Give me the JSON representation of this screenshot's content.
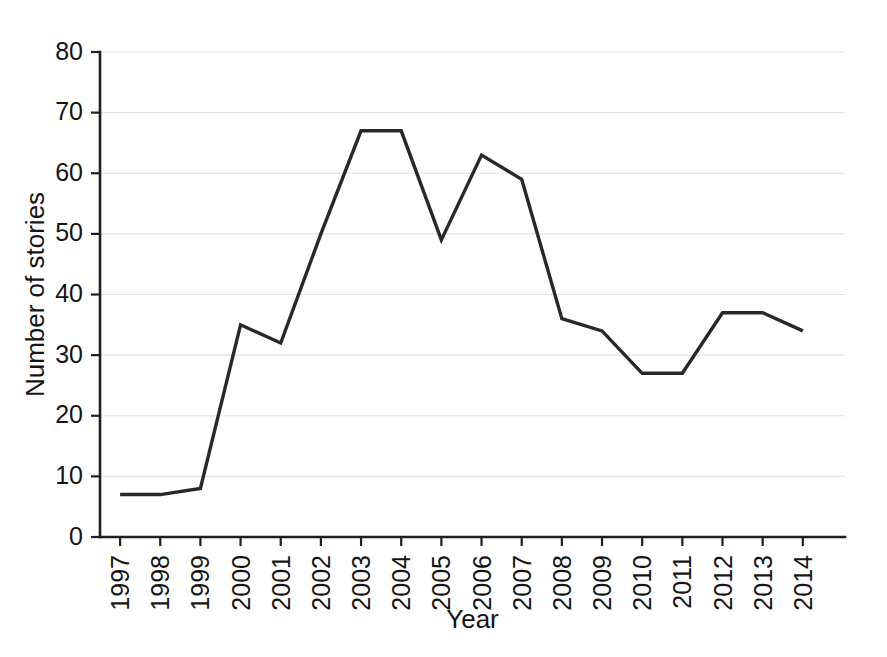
{
  "chart_data": {
    "type": "line",
    "title": "",
    "xlabel": "Year",
    "ylabel": "Number of stories",
    "categories": [
      "1997",
      "1998",
      "1999",
      "2000",
      "2001",
      "2002",
      "2003",
      "2004",
      "2005",
      "2006",
      "2007",
      "2008",
      "2009",
      "2010",
      "2011",
      "2012",
      "2013",
      "2014"
    ],
    "values": [
      7,
      7,
      8,
      35,
      32,
      50,
      67,
      67,
      49,
      63,
      59,
      36,
      34,
      27,
      27,
      37,
      37,
      34
    ],
    "series": [
      {
        "name": "Number of stories",
        "values": [
          7,
          7,
          8,
          35,
          32,
          50,
          67,
          67,
          49,
          63,
          59,
          36,
          34,
          27,
          27,
          37,
          37,
          34
        ]
      }
    ],
    "ylim": [
      0,
      80
    ],
    "ytick_values": [
      0,
      10,
      20,
      30,
      40,
      50,
      60,
      70,
      80
    ],
    "ytick_labels": [
      "0",
      "10",
      "20",
      "30",
      "40",
      "50",
      "60",
      "70",
      "80"
    ],
    "xtick_labels": [
      "1997",
      "1998",
      "1999",
      "2000",
      "2001",
      "2002",
      "2003",
      "2004",
      "2005",
      "2006",
      "2007",
      "2008",
      "2009",
      "2010",
      "2011",
      "2012",
      "2013",
      "2014"
    ],
    "xtick_rotation": 90,
    "grid": true,
    "grid_axis": "y",
    "legend": false,
    "legend_position": "none",
    "line_color": "#282828",
    "grid_color": "#e2e2e6",
    "axis_color": "#1f1f1f",
    "background_color": "#ffffff"
  }
}
